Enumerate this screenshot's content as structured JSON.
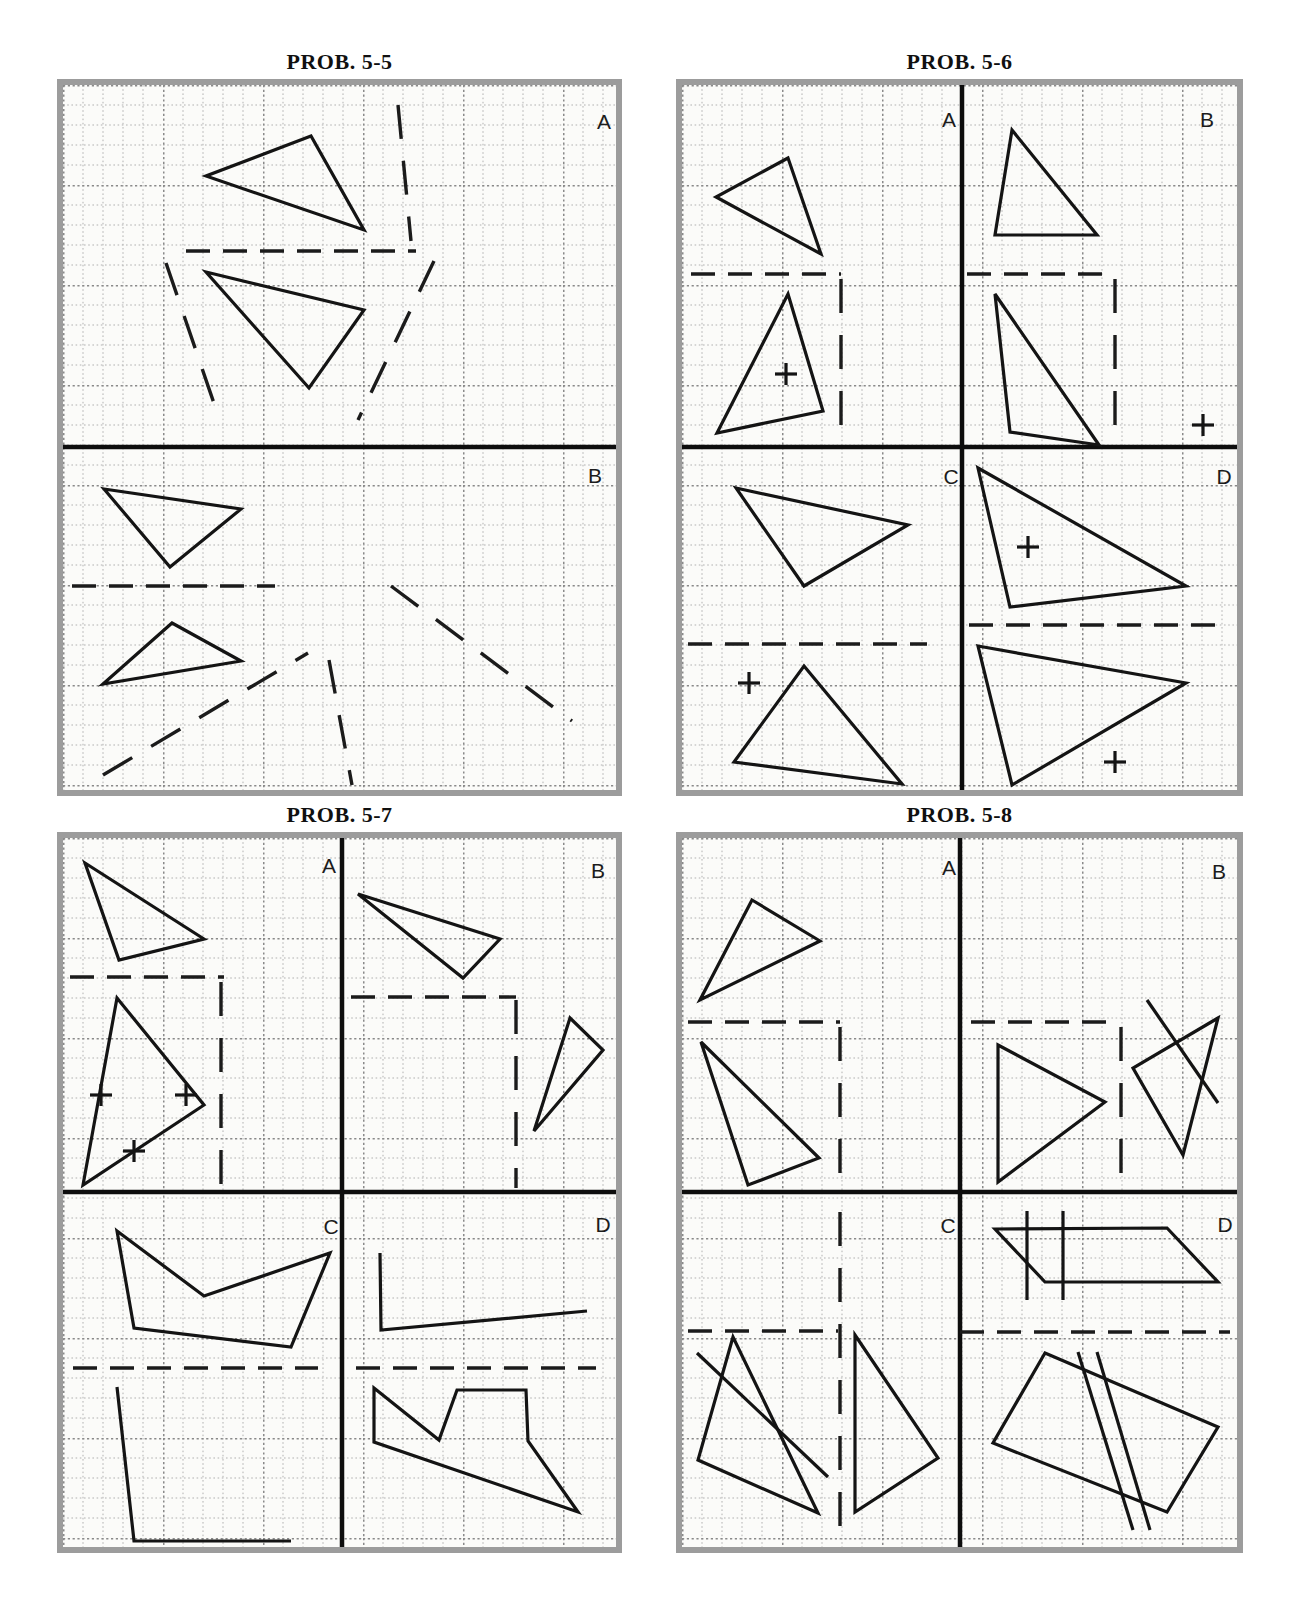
{
  "colors": {
    "ink": "#141414",
    "dash_ink": "#1b1b1b",
    "divider": "#0d0d0d",
    "grid_minor": "#b2b2b2",
    "grid_major": "#8a8a8a",
    "paper": "#fbfbf9",
    "border": "#9c9c9c",
    "label": "#1c1c1c",
    "title": "#101010"
  },
  "grid": {
    "cell": 20,
    "major_every": 100
  },
  "panels": [
    {
      "id": "prob-5-5",
      "title": "PROB. 5-5",
      "x": 63,
      "y": 85,
      "w": 553,
      "h": 705,
      "divider_v": null,
      "divider_h": 362,
      "labels": [
        {
          "t": "A",
          "x": 541,
          "y": 36
        },
        {
          "t": "B",
          "x": 532,
          "y": 390
        }
      ],
      "solids": [
        [
          [
            248,
            51
          ],
          [
            143,
            91
          ],
          [
            301,
            145
          ]
        ],
        [
          [
            143,
            187
          ],
          [
            301,
            225
          ],
          [
            246,
            303
          ]
        ],
        [
          [
            41,
            404
          ],
          [
            178,
            424
          ],
          [
            107,
            482
          ]
        ],
        [
          [
            109,
            538
          ],
          [
            178,
            576
          ],
          [
            40,
            599
          ]
        ]
      ],
      "lines": [],
      "dashes": [
        {
          "pts": [
            [
              335,
              20
            ],
            [
              348,
              156
            ]
          ],
          "style": "long"
        },
        {
          "pts": [
            [
              123,
              166
            ],
            [
              353,
              166
            ]
          ],
          "style": "std"
        },
        {
          "pts": [
            [
              103,
              178
            ],
            [
              156,
              333
            ]
          ],
          "style": "long"
        },
        {
          "pts": [
            [
              371,
              176
            ],
            [
              295,
              335
            ]
          ],
          "style": "long"
        },
        {
          "pts": [
            [
              9,
              501
            ],
            [
              212,
              501
            ]
          ],
          "style": "std"
        },
        {
          "pts": [
            [
              40,
              690
            ],
            [
              245,
              568
            ]
          ],
          "style": "long"
        },
        {
          "pts": [
            [
              266,
              575
            ],
            [
              289,
              700
            ]
          ],
          "style": "long"
        },
        {
          "pts": [
            [
              328,
              501
            ],
            [
              509,
              636
            ]
          ],
          "style": "long"
        }
      ],
      "plusses": []
    },
    {
      "id": "prob-5-6",
      "title": "PROB. 5-6",
      "x": 682,
      "y": 85,
      "w": 555,
      "h": 705,
      "divider_v": 280,
      "divider_h": 362,
      "labels": [
        {
          "t": "A",
          "x": 267,
          "y": 34
        },
        {
          "t": "B",
          "x": 525,
          "y": 34
        },
        {
          "t": "C",
          "x": 269,
          "y": 391
        },
        {
          "t": "D",
          "x": 542,
          "y": 391
        }
      ],
      "solids": [
        [
          [
            106,
            73
          ],
          [
            34,
            112
          ],
          [
            139,
            169
          ]
        ],
        [
          [
            106,
            209
          ],
          [
            141,
            326
          ],
          [
            35,
            348
          ]
        ],
        [
          [
            330,
            45
          ],
          [
            313,
            150
          ],
          [
            415,
            150
          ]
        ],
        [
          [
            313,
            209
          ],
          [
            417,
            360
          ],
          [
            328,
            347
          ]
        ],
        [
          [
            54,
            403
          ],
          [
            226,
            440
          ],
          [
            122,
            501
          ]
        ],
        [
          [
            122,
            581
          ],
          [
            220,
            699
          ],
          [
            52,
            677
          ]
        ],
        [
          [
            296,
            383
          ],
          [
            504,
            501
          ],
          [
            328,
            522
          ]
        ],
        [
          [
            296,
            561
          ],
          [
            504,
            598
          ],
          [
            330,
            700
          ]
        ]
      ],
      "lines": [],
      "dashes": [
        {
          "pts": [
            [
              9,
              189
            ],
            [
              159,
              189
            ]
          ],
          "style": "std"
        },
        {
          "pts": [
            [
              159,
              194
            ],
            [
              159,
              360
            ]
          ],
          "style": "long"
        },
        {
          "pts": [
            [
              285,
              189
            ],
            [
              428,
              189
            ]
          ],
          "style": "std"
        },
        {
          "pts": [
            [
              433,
              194
            ],
            [
              433,
              360
            ]
          ],
          "style": "long"
        },
        {
          "pts": [
            [
              6,
              559
            ],
            [
              245,
              559
            ]
          ],
          "style": "std"
        },
        {
          "pts": [
            [
              287,
              540
            ],
            [
              541,
              540
            ]
          ],
          "style": "std"
        }
      ],
      "plusses": [
        [
          104,
          289
        ],
        [
          521,
          340
        ],
        [
          67,
          598
        ],
        [
          346,
          462
        ],
        [
          433,
          677
        ]
      ]
    },
    {
      "id": "prob-5-7",
      "title": "PROB. 5-7",
      "x": 63,
      "y": 838,
      "w": 553,
      "h": 709,
      "divider_v": 279,
      "divider_h": 354,
      "labels": [
        {
          "t": "A",
          "x": 266,
          "y": 27
        },
        {
          "t": "B",
          "x": 535,
          "y": 32
        },
        {
          "t": "C",
          "x": 268,
          "y": 388
        },
        {
          "t": "D",
          "x": 540,
          "y": 386
        }
      ],
      "solids": [
        [
          [
            22,
            25
          ],
          [
            141,
            101
          ],
          [
            56,
            122
          ]
        ],
        [
          [
            54,
            160
          ],
          [
            141,
            267
          ],
          [
            20,
            347
          ]
        ],
        [
          [
            295,
            56
          ],
          [
            437,
            101
          ],
          [
            400,
            140
          ]
        ],
        [
          [
            507,
            180
          ],
          [
            540,
            212
          ],
          [
            471,
            293
          ]
        ],
        [
          [
            54,
            393
          ],
          [
            141,
            458
          ],
          [
            267,
            415
          ],
          [
            228,
            509
          ],
          [
            71,
            490
          ]
        ],
        [
          [
            311,
            550
          ],
          [
            376,
            602
          ],
          [
            394,
            552
          ],
          [
            463,
            552
          ],
          [
            465,
            603
          ],
          [
            515,
            674
          ],
          [
            311,
            604
          ]
        ]
      ],
      "lines": [
        [
          [
            54,
            549
          ],
          [
            71,
            703
          ],
          [
            228,
            703
          ]
        ],
        [
          [
            317,
            415
          ],
          [
            318,
            492
          ],
          [
            524,
            473
          ]
        ]
      ],
      "dashes": [
        {
          "pts": [
            [
              7,
              139
            ],
            [
              161,
              139
            ]
          ],
          "style": "std"
        },
        {
          "pts": [
            [
              158,
              144
            ],
            [
              158,
              350
            ]
          ],
          "style": "long"
        },
        {
          "pts": [
            [
              288,
              159
            ],
            [
              453,
              159
            ]
          ],
          "style": "std"
        },
        {
          "pts": [
            [
              453,
              162
            ],
            [
              453,
              350
            ]
          ],
          "style": "long"
        },
        {
          "pts": [
            [
              10,
              530
            ],
            [
              255,
              530
            ]
          ],
          "style": "std"
        },
        {
          "pts": [
            [
              293,
              530
            ],
            [
              533,
              530
            ]
          ],
          "style": "std"
        }
      ],
      "plusses": [
        [
          38,
          257
        ],
        [
          123,
          257
        ],
        [
          71,
          313
        ]
      ]
    },
    {
      "id": "prob-5-8",
      "title": "PROB. 5-8",
      "x": 682,
      "y": 838,
      "w": 555,
      "h": 709,
      "divider_v": 278,
      "divider_h": 354,
      "labels": [
        {
          "t": "A",
          "x": 267,
          "y": 29
        },
        {
          "t": "B",
          "x": 537,
          "y": 33
        },
        {
          "t": "C",
          "x": 266,
          "y": 387
        },
        {
          "t": "D",
          "x": 543,
          "y": 386
        }
      ],
      "solids": [
        [
          [
            70,
            62
          ],
          [
            138,
            103
          ],
          [
            18,
            162
          ]
        ],
        [
          [
            19,
            204
          ],
          [
            137,
            320
          ],
          [
            66,
            347
          ]
        ],
        [
          [
            316,
            207
          ],
          [
            423,
            264
          ],
          [
            316,
            344
          ]
        ],
        [
          [
            536,
            180
          ],
          [
            451,
            230
          ],
          [
            501,
            317
          ]
        ],
        [
          [
            51,
            499
          ],
          [
            16,
            622
          ],
          [
            136,
            675
          ]
        ],
        [
          [
            173,
            497
          ],
          [
            256,
            620
          ],
          [
            173,
            674
          ]
        ],
        [
          [
            313,
            391
          ],
          [
            485,
            390
          ],
          [
            536,
            444
          ],
          [
            363,
            444
          ]
        ],
        [
          [
            363,
            515
          ],
          [
            536,
            589
          ],
          [
            485,
            674
          ],
          [
            311,
            605
          ]
        ]
      ],
      "lines": [
        [
          [
            465,
            162
          ],
          [
            536,
            265
          ]
        ],
        [
          [
            15,
            515
          ],
          [
            146,
            639
          ]
        ],
        [
          [
            345,
            373
          ],
          [
            345,
            462
          ]
        ],
        [
          [
            381,
            373
          ],
          [
            381,
            462
          ]
        ],
        [
          [
            396,
            514
          ],
          [
            451,
            692
          ]
        ],
        [
          [
            415,
            514
          ],
          [
            468,
            692
          ]
        ]
      ],
      "dashes": [
        {
          "pts": [
            [
              6,
              184
            ],
            [
              158,
              184
            ]
          ],
          "style": "std"
        },
        {
          "pts": [
            [
              158,
              189
            ],
            [
              158,
              352
            ]
          ],
          "style": "long"
        },
        {
          "pts": [
            [
              289,
              184
            ],
            [
              432,
              184
            ]
          ],
          "style": "std"
        },
        {
          "pts": [
            [
              439,
              189
            ],
            [
              439,
              347
            ]
          ],
          "style": "long"
        },
        {
          "pts": [
            [
              6,
              493
            ],
            [
              156,
              493
            ]
          ],
          "style": "std"
        },
        {
          "pts": [
            [
              158,
              374
            ],
            [
              158,
              705
            ]
          ],
          "style": "long"
        },
        {
          "pts": [
            [
              278,
              494
            ],
            [
              548,
              494
            ]
          ],
          "style": "std"
        }
      ],
      "plusses": []
    }
  ]
}
